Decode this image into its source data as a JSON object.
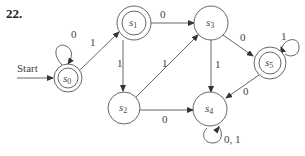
{
  "problem_number": "22.",
  "start_label": "Start",
  "states": [
    {
      "id": "s0",
      "base": "s",
      "sub": "0",
      "accepting": true
    },
    {
      "id": "s1",
      "base": "s",
      "sub": "1",
      "accepting": true
    },
    {
      "id": "s2",
      "base": "s",
      "sub": "2",
      "accepting": false
    },
    {
      "id": "s3",
      "base": "s",
      "sub": "3",
      "accepting": false
    },
    {
      "id": "s4",
      "base": "s",
      "sub": "4",
      "accepting": false
    },
    {
      "id": "s5",
      "base": "s",
      "sub": "5",
      "accepting": true
    }
  ],
  "transitions": [
    {
      "from": "s0",
      "to": "s0",
      "label": "0"
    },
    {
      "from": "s0",
      "to": "s1",
      "label": "1"
    },
    {
      "from": "s1",
      "to": "s3",
      "label": "0"
    },
    {
      "from": "s1",
      "to": "s2",
      "label": "1"
    },
    {
      "from": "s2",
      "to": "s3",
      "label": "1"
    },
    {
      "from": "s2",
      "to": "s4",
      "label": "0"
    },
    {
      "from": "s3",
      "to": "s5",
      "label": "0"
    },
    {
      "from": "s3",
      "to": "s4",
      "label": "1"
    },
    {
      "from": "s5",
      "to": "s5",
      "label": "1"
    },
    {
      "from": "s5",
      "to": "s4",
      "label": "0"
    },
    {
      "from": "s4",
      "to": "s4",
      "label": "0, 1"
    }
  ],
  "colors": {
    "stroke": "#555555",
    "text": "#444444"
  }
}
